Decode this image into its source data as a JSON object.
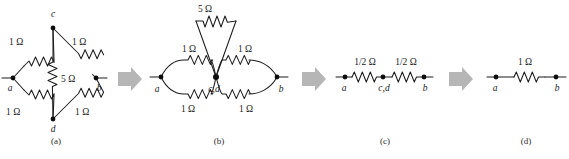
{
  "figure": {
    "type": "circuit-simplification-sequence",
    "background_color": "#ffffff",
    "line_color": "#1c1c1c",
    "arrow_color": "#b6b6b6",
    "ohm_symbol": "Ω"
  },
  "captions": {
    "a": "(a)",
    "b": "(b)",
    "c": "(c)",
    "d": "(d)"
  },
  "panels": [
    {
      "id": "a",
      "caption": "(a)",
      "description": "Diamond bridge network with four 1 ohm arms and a 5 ohm bridge between nodes c and d",
      "nodes": [
        {
          "name": "a",
          "label": "a"
        },
        {
          "name": "b",
          "label": "b"
        },
        {
          "name": "c",
          "label": "c"
        },
        {
          "name": "d",
          "label": "d"
        }
      ],
      "resistors": [
        {
          "name": "r-ac",
          "value": "1 Ω",
          "between": [
            "a",
            "c"
          ]
        },
        {
          "name": "r-cb",
          "value": "1 Ω",
          "between": [
            "c",
            "b"
          ]
        },
        {
          "name": "r-ad",
          "value": "1 Ω",
          "between": [
            "a",
            "d"
          ]
        },
        {
          "name": "r-db",
          "value": "1 Ω",
          "between": [
            "d",
            "b"
          ]
        },
        {
          "name": "r-cd",
          "value": "5 Ω",
          "between": [
            "c",
            "d"
          ]
        }
      ],
      "labels": {
        "top_left": "1 Ω",
        "top_right": "1 Ω",
        "bottom_left": "1 Ω",
        "bottom_right": "1 Ω",
        "bridge": "5 Ω",
        "node_a": "a",
        "node_b": "b",
        "node_c": "c",
        "node_d": "d"
      }
    },
    {
      "id": "b",
      "caption": "(b)",
      "description": "Nodes c and d merged; 5 ohm resistor becomes a shorted loop, two 1 ohm pairs in parallel on each side",
      "nodes": [
        {
          "name": "a",
          "label": "a"
        },
        {
          "name": "b",
          "label": "b"
        },
        {
          "name": "cd",
          "label": "c,d"
        }
      ],
      "resistors": [
        {
          "name": "r-ac-top",
          "value": "1 Ω",
          "between": [
            "a",
            "c,d"
          ]
        },
        {
          "name": "r-ad-bottom",
          "value": "1 Ω",
          "between": [
            "a",
            "c,d"
          ]
        },
        {
          "name": "r-cb-top",
          "value": "1 Ω",
          "between": [
            "c,d",
            "b"
          ]
        },
        {
          "name": "r-db-bottom",
          "value": "1 Ω",
          "between": [
            "c,d",
            "b"
          ]
        },
        {
          "name": "r-loop",
          "value": "5 Ω",
          "between": [
            "c,d",
            "c,d"
          ]
        }
      ],
      "labels": {
        "loop": "5 Ω",
        "left_top": "1 Ω",
        "left_bottom": "1 Ω",
        "right_top": "1 Ω",
        "right_bottom": "1 Ω",
        "node_a": "a",
        "node_b": "b",
        "node_cd": "c,d"
      }
    },
    {
      "id": "c",
      "caption": "(c)",
      "description": "Each parallel pair reduces to one half ohm in series",
      "nodes": [
        {
          "name": "a",
          "label": "a"
        },
        {
          "name": "cd",
          "label": "c,d"
        },
        {
          "name": "b",
          "label": "b"
        }
      ],
      "resistors": [
        {
          "name": "r-left",
          "value": "1/2 Ω",
          "between": [
            "a",
            "c,d"
          ]
        },
        {
          "name": "r-right",
          "value": "1/2 Ω",
          "between": [
            "c,d",
            "b"
          ]
        }
      ],
      "labels": {
        "left": "1/2 Ω",
        "right": "1/2 Ω",
        "node_a": "a",
        "node_cd": "c,d",
        "node_b": "b"
      }
    },
    {
      "id": "d",
      "caption": "(d)",
      "description": "Final equivalent single 1 ohm resistor between a and b",
      "nodes": [
        {
          "name": "a",
          "label": "a"
        },
        {
          "name": "b",
          "label": "b"
        }
      ],
      "resistors": [
        {
          "name": "r-eq",
          "value": "1 Ω",
          "between": [
            "a",
            "b"
          ]
        }
      ],
      "labels": {
        "value": "1 Ω",
        "node_a": "a",
        "node_b": "b"
      }
    }
  ],
  "arrows": [
    {
      "name": "arrow-a-to-b",
      "direction": "right"
    },
    {
      "name": "arrow-b-to-c",
      "direction": "right"
    },
    {
      "name": "arrow-c-to-d",
      "direction": "right"
    }
  ]
}
